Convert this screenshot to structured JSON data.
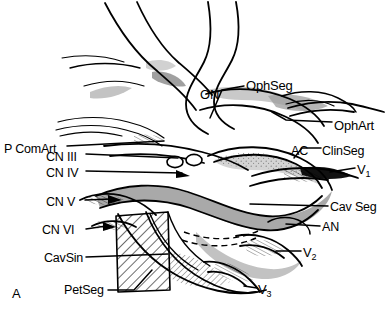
{
  "figure": {
    "panel_id": "A",
    "caption_style": "anatomical line drawing of the cavernous sinus and internal carotid artery segments"
  },
  "labels": {
    "pcomart": {
      "text": "P ComArt",
      "x": 4,
      "y": 150,
      "align": "left"
    },
    "cn3": {
      "text": "CN III",
      "x": 46,
      "y": 157,
      "align": "left"
    },
    "cn4": {
      "text": "CN IV",
      "x": 46,
      "y": 174,
      "align": "left"
    },
    "cn5": {
      "text": "CN V",
      "x": 46,
      "y": 203,
      "align": "left"
    },
    "cn6": {
      "text": "CN VI",
      "x": 42,
      "y": 232,
      "align": "left"
    },
    "cavsin": {
      "text": "CavSin",
      "x": 44,
      "y": 260,
      "align": "left"
    },
    "petseg": {
      "text": "PetSeg",
      "x": 66,
      "y": 293,
      "align": "left"
    },
    "on": {
      "text": "ON",
      "x": 200,
      "y": 95,
      "align": "left"
    },
    "ophseg": {
      "text": "OphSeg",
      "x": 246,
      "y": 85,
      "align": "left"
    },
    "ophart": {
      "text": "OphArt",
      "x": 334,
      "y": 125,
      "align": "left"
    },
    "ac": {
      "text": "AC",
      "x": 291,
      "y": 151,
      "align": "left"
    },
    "clinseg": {
      "text": "ClinSeg",
      "x": 323,
      "y": 151,
      "align": "left"
    },
    "v1": {
      "text": "V",
      "sub": "1",
      "x": 357,
      "y": 170,
      "align": "left"
    },
    "cavseg": {
      "text": "Cav Seg",
      "x": 330,
      "y": 208,
      "align": "left"
    },
    "an": {
      "text": "AN",
      "x": 322,
      "y": 228,
      "align": "left"
    },
    "v2": {
      "text": "V",
      "sub": "2",
      "x": 303,
      "y": 253,
      "align": "left"
    },
    "v3": {
      "text": "V",
      "sub": "3",
      "x": 258,
      "y": 290,
      "align": "left"
    }
  },
  "colors": {
    "ink": "#000000",
    "paper": "#ffffff",
    "gray_band": "#a8a8a8",
    "gray_light": "#cfcfcf",
    "gray_mid": "#bdbdbd",
    "stipple": "#9a9a9a"
  },
  "structures": [
    {
      "name": "internal-carotid-artery",
      "kind": "vessel-outline"
    },
    {
      "name": "optic-nerve",
      "kind": "nerve"
    },
    {
      "name": "cavernous-sinus",
      "kind": "hatched-region"
    },
    {
      "name": "cavernous-segment-band",
      "kind": "shaded-band"
    },
    {
      "name": "trigeminal-divisions",
      "kind": "nerve-group"
    },
    {
      "name": "anterior-clinoid",
      "kind": "bone"
    }
  ]
}
